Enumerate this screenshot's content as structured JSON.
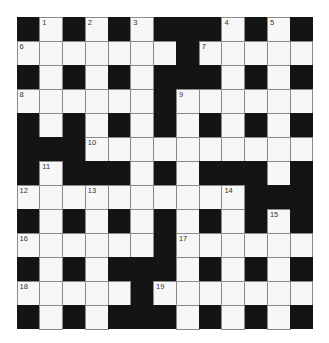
{
  "puzzle": {
    "rows": 13,
    "cols": 13,
    "layout": [
      "#.#.#.###.#.#",
      ".......#.....",
      "#.#.#.###.#.#",
      "......#......",
      "#.#.#.#.#.#.#",
      "###..........",
      "#.###.#.###.#",
      "..........###",
      "#.#.#.#.#..#",
      "......#......",
      "#.#.###.#.#.#",
      ".....#.......",
      "#.#.###.#.#.#"
    ],
    "numbers": [
      {
        "n": "1",
        "r": 0,
        "c": 1
      },
      {
        "n": "2",
        "r": 0,
        "c": 3
      },
      {
        "n": "3",
        "r": 0,
        "c": 5
      },
      {
        "n": "4",
        "r": 0,
        "c": 9
      },
      {
        "n": "5",
        "r": 0,
        "c": 11
      },
      {
        "n": "6",
        "r": 1,
        "c": 0
      },
      {
        "n": "7",
        "r": 1,
        "c": 8
      },
      {
        "n": "8",
        "r": 3,
        "c": 0
      },
      {
        "n": "9",
        "r": 3,
        "c": 7
      },
      {
        "n": "10",
        "r": 5,
        "c": 3
      },
      {
        "n": "11",
        "r": 6,
        "c": 1
      },
      {
        "n": "12",
        "r": 7,
        "c": 0
      },
      {
        "n": "13",
        "r": 7,
        "c": 3
      },
      {
        "n": "14",
        "r": 7,
        "c": 9
      },
      {
        "n": "15",
        "r": 8,
        "c": 11
      },
      {
        "n": "16",
        "r": 9,
        "c": 0
      },
      {
        "n": "17",
        "r": 9,
        "c": 7
      },
      {
        "n": "18",
        "r": 11,
        "c": 0
      },
      {
        "n": "19",
        "r": 11,
        "c": 6
      }
    ]
  },
  "colors": {
    "block": "#141414",
    "cell": "#f7f7f7",
    "gridline": "#8a8a8a",
    "number": "#333333"
  }
}
